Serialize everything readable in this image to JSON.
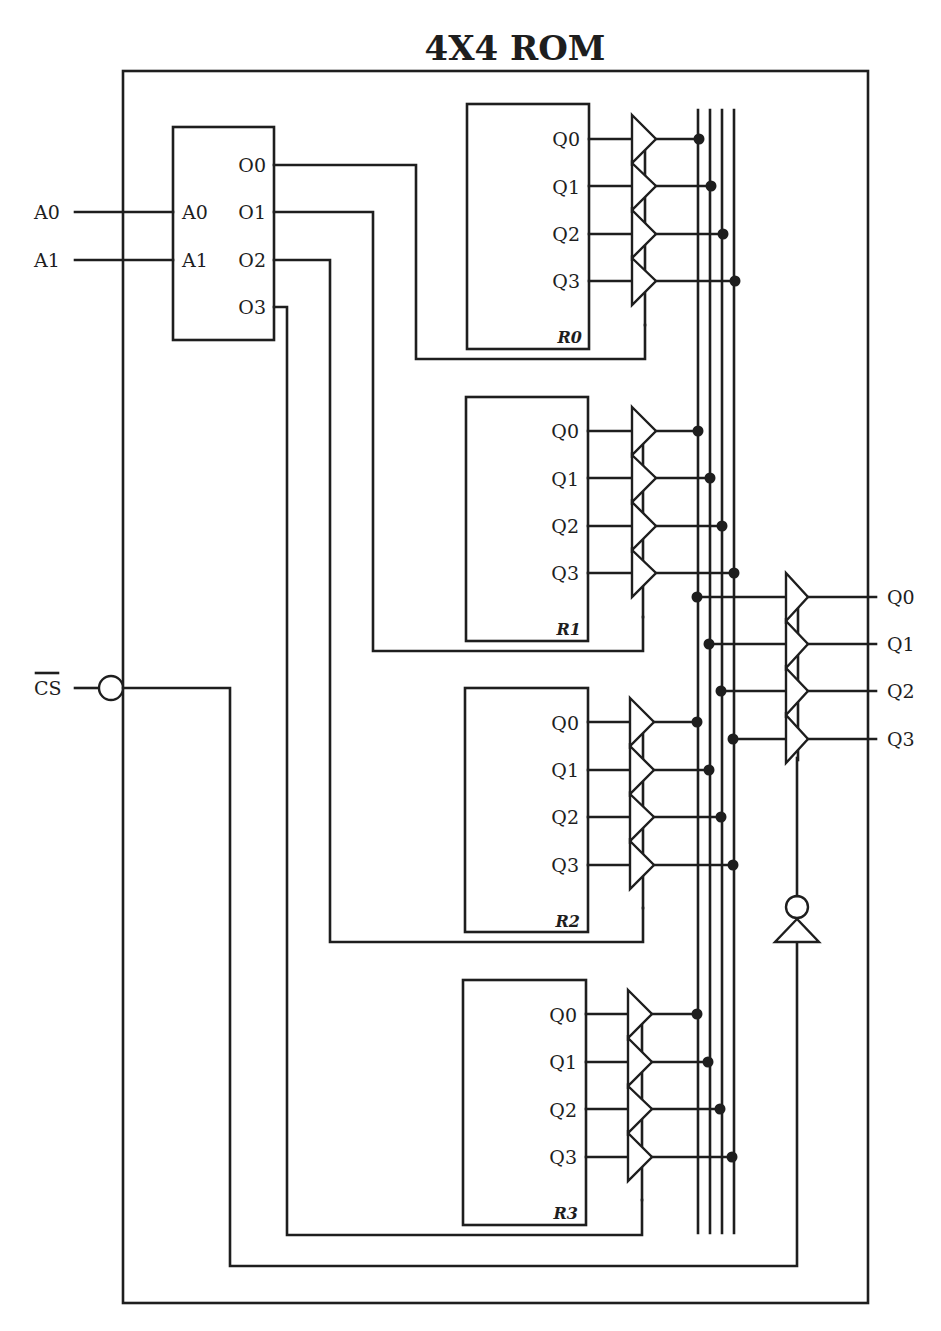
{
  "title": "4X4 ROM",
  "decoder": {
    "inputs": [
      "A0",
      "A1"
    ],
    "outputs": [
      "O0",
      "O1",
      "O2",
      "O3"
    ]
  },
  "external_inputs": [
    "A0",
    "A1"
  ],
  "chip_select": {
    "label": "CS",
    "active_low": true
  },
  "registers": [
    {
      "name": "R0",
      "outputs": [
        "Q0",
        "Q1",
        "Q2",
        "Q3"
      ]
    },
    {
      "name": "R1",
      "outputs": [
        "Q0",
        "Q1",
        "Q2",
        "Q3"
      ]
    },
    {
      "name": "R2",
      "outputs": [
        "Q0",
        "Q1",
        "Q2",
        "Q3"
      ]
    },
    {
      "name": "R3",
      "outputs": [
        "Q0",
        "Q1",
        "Q2",
        "Q3"
      ]
    }
  ],
  "outputs": [
    "Q0",
    "Q1",
    "Q2",
    "Q3"
  ],
  "colors": {
    "line": "#1e1e1e",
    "background": "#ffffff"
  }
}
